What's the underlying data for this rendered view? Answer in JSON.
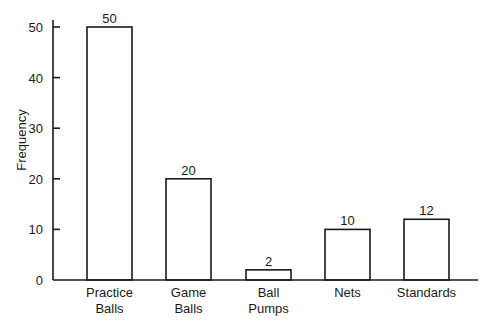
{
  "chart_data": {
    "type": "bar",
    "title": "",
    "xlabel": "",
    "ylabel": "Frequency",
    "ylim": [
      0,
      50
    ],
    "yticks": [
      0,
      10,
      20,
      30,
      40,
      50
    ],
    "grid": false,
    "legend": null,
    "categories": [
      "Practice Balls",
      "Game Balls",
      "Ball Pumps",
      "Nets",
      "Standards"
    ],
    "category_lines": [
      [
        "Practice",
        "Balls"
      ],
      [
        "Game",
        "Balls"
      ],
      [
        "Ball",
        "Pumps"
      ],
      [
        "Nets"
      ],
      [
        "Standards"
      ]
    ],
    "values": [
      50,
      20,
      2,
      10,
      12
    ],
    "value_labels": [
      "50",
      "20",
      "2",
      "10",
      "12"
    ],
    "bar_fill": "#ffffff",
    "bar_stroke": "#1a1a1a"
  }
}
